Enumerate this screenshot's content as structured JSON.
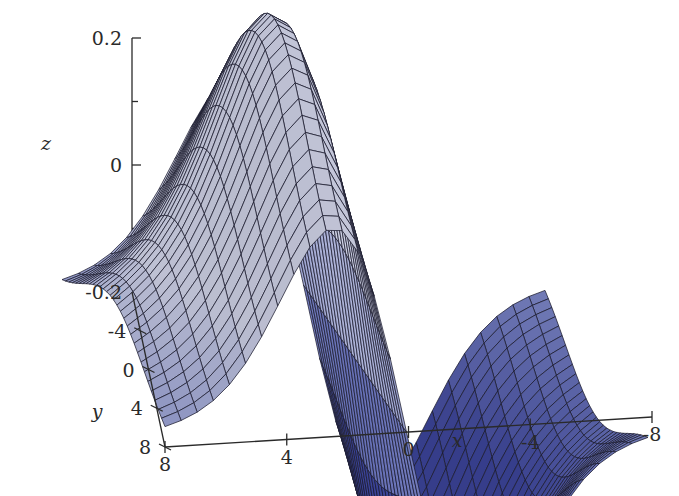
{
  "figure": {
    "kind": "3d-surface-plot",
    "background": "#ffffff",
    "mesh_line_color": "#1b1b2e",
    "surface_low_color": "#3b4397",
    "surface_mid_color": "#6f79bd",
    "surface_high_color": "#c2c6de",
    "axis_color": "#2a2a2a"
  },
  "chart_data": {
    "type": "surface",
    "title": "",
    "xlabel": "x",
    "ylabel": "y",
    "zlabel": "z",
    "xlim": [
      -8,
      8
    ],
    "ylim": [
      -8,
      8
    ],
    "zlim": [
      -0.25,
      0.25
    ],
    "grid": false,
    "legend": "none",
    "x_ticks": [
      {
        "value": 8,
        "label": "8"
      },
      {
        "value": 4,
        "label": "4"
      },
      {
        "value": 0,
        "label": "0"
      },
      {
        "value": -4,
        "label": "-4"
      },
      {
        "value": -8,
        "label": "-8"
      }
    ],
    "y_ticks": [
      {
        "value": -4,
        "label": "-4"
      },
      {
        "value": 0,
        "label": "0"
      },
      {
        "value": 4,
        "label": "4"
      },
      {
        "value": 8,
        "label": "8"
      }
    ],
    "z_ticks": [
      {
        "value": 0.2,
        "label": "0.2",
        "major": true
      },
      {
        "value": 0.1,
        "label": "",
        "major": false
      },
      {
        "value": 0.0,
        "label": "0",
        "major": true
      },
      {
        "value": -0.1,
        "label": "",
        "major": false
      },
      {
        "value": -0.2,
        "label": "-0.2",
        "major": true
      }
    ],
    "mesh_divisions": 30,
    "surface_description": "Antisymmetric saddle-wave surface: a ridge peaking near z=+0.15 over the left (large positive x) half and a trough dipping to about z=-0.22 over the right (negative x) half, with a steep transition crossing z=0 near x=0.",
    "z_min_observed": -0.22,
    "z_max_observed": 0.15
  },
  "axis_labels": {
    "x": "x",
    "y": "y",
    "z": "z"
  }
}
